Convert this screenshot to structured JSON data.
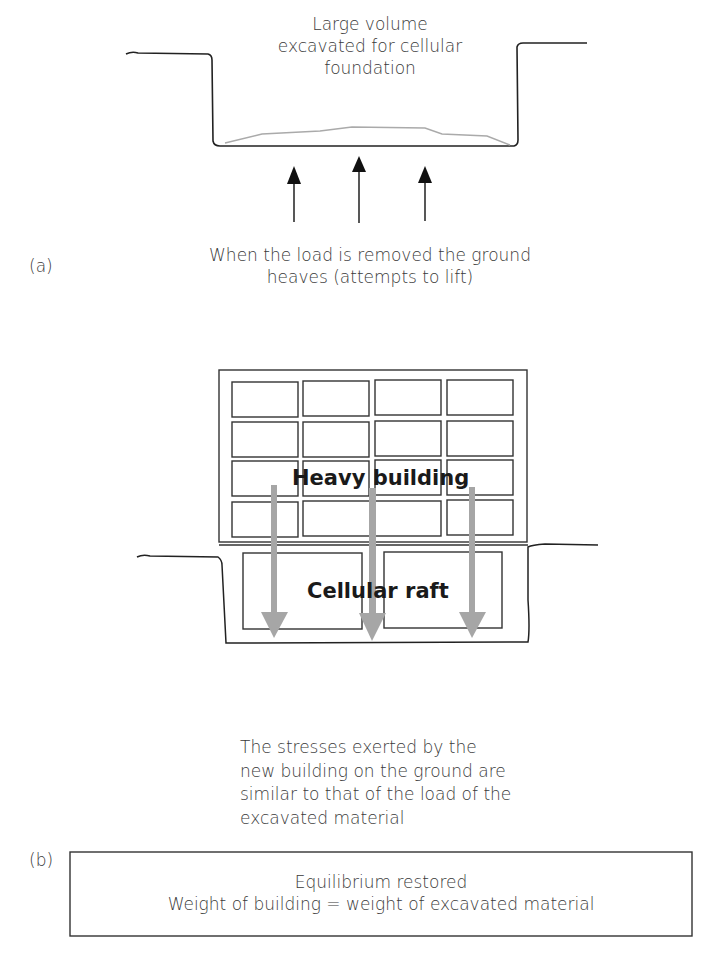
{
  "panel_a": {
    "label": "(a)",
    "excavation_label": [
      "Large volume",
      "excavated for cellular",
      "foundation"
    ],
    "heave_caption": [
      "When the load is removed the ground",
      "heaves (attempts to lift)"
    ],
    "arrows": {
      "count": 3,
      "direction": "up",
      "color": "#111111"
    }
  },
  "panel_b": {
    "label": "(b)",
    "building_label": "Heavy building",
    "raft_label": "Cellular raft",
    "window_grid": {
      "rows": 4,
      "cols": 4
    },
    "raft_cells": 2,
    "arrows": {
      "count": 3,
      "direction": "down",
      "color": "#a6a6a6"
    },
    "stress_caption": [
      "The stresses exerted by the",
      "new building on the ground are",
      "similar to that of the load of the",
      "excavated material"
    ],
    "equilibrium_box": {
      "title": "Equilibrium restored",
      "equation": "Weight of building = weight of excavated material"
    }
  }
}
